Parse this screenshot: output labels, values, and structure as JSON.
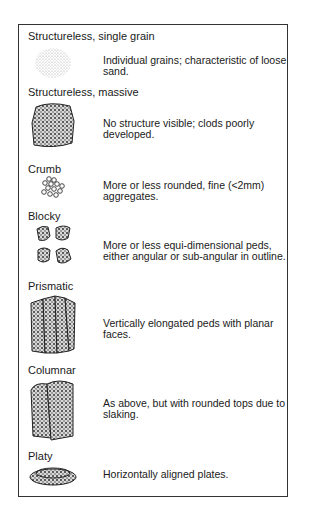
{
  "diagram": {
    "items": [
      {
        "name": "Structureless, single grain",
        "description": "Individual grains; characteristic of loose sand.",
        "icon": "scattered-grains-icon"
      },
      {
        "name": "Structureless, massive",
        "description": "No structure visible; clods poorly developed.",
        "icon": "massive-clod-icon"
      },
      {
        "name": "Crumb",
        "description": "More or less rounded, fine (<2mm) aggregates.",
        "icon": "crumb-aggregates-icon"
      },
      {
        "name": "Blocky",
        "description": "More or less equi-dimensional peds, either angular or sub-angular in outline.",
        "icon": "blocky-peds-icon"
      },
      {
        "name": "Prismatic",
        "description": "Vertically elongated peds with planar faces.",
        "icon": "prismatic-peds-icon"
      },
      {
        "name": "Columnar",
        "description": "As above, but with rounded tops due to slaking.",
        "icon": "columnar-peds-icon"
      },
      {
        "name": "Platy",
        "description": "Horizontally aligned plates.",
        "icon": "platy-plates-icon"
      }
    ]
  }
}
